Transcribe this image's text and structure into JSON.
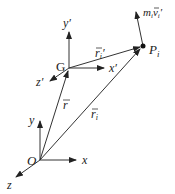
{
  "diagram": {
    "stroke_color": "#333333",
    "points": {
      "O": {
        "label": "O",
        "x": 40,
        "y": 160
      },
      "G": {
        "label": "G",
        "x": 69,
        "y": 68
      },
      "P": {
        "label": "P",
        "sub": "i",
        "x": 143,
        "y": 46
      }
    },
    "axes_O": {
      "x": {
        "label": "x"
      },
      "y": {
        "label": "y"
      },
      "z": {
        "label": "z"
      }
    },
    "axes_G": {
      "x": {
        "label": "x′"
      },
      "y": {
        "label": "y′"
      },
      "z": {
        "label": "z′"
      }
    },
    "vectors": {
      "r_bar": {
        "label": "r",
        "accent": "‾",
        "desc": "O to G"
      },
      "r_i": {
        "label": "r",
        "sub": "i",
        "desc": "O to P_i"
      },
      "r_i_prime": {
        "label": "r",
        "sub": "i",
        "prime": "′",
        "desc": "G to P_i"
      },
      "momentum": {
        "m": "m",
        "m_sub": "i",
        "v": "v",
        "v_sub": "i",
        "prime": "′",
        "desc": "m_i v_i′ at P_i"
      }
    }
  }
}
